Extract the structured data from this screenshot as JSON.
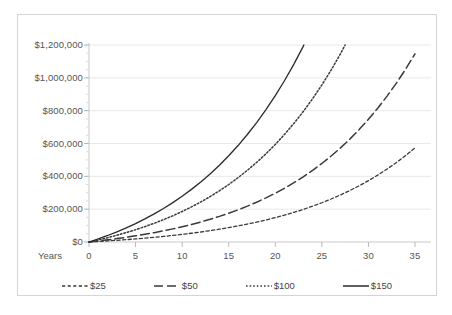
{
  "chart_data": {
    "type": "line",
    "title": "",
    "subtitle": "",
    "xlabel": "Years",
    "ylabel": "",
    "xlim": [
      0,
      35
    ],
    "ylim": [
      0,
      1200000
    ],
    "grid": true,
    "legend_position": "bottom",
    "x_ticks": [
      "0",
      "5",
      "10",
      "15",
      "20",
      "25",
      "30",
      "35"
    ],
    "x_tick_values": [
      0,
      5,
      10,
      15,
      20,
      25,
      30,
      35
    ],
    "y_ticks": [
      "$0",
      "$200,000",
      "$400,000",
      "$600,000",
      "$800,000",
      "$1,000,000",
      "$1,200,000"
    ],
    "y_tick_values": [
      0,
      200000,
      400000,
      600000,
      800000,
      1000000,
      1200000
    ],
    "x": [
      0,
      1,
      2,
      3,
      4,
      5,
      6,
      7,
      8,
      9,
      10,
      11,
      12,
      13,
      14,
      15,
      16,
      17,
      18,
      19,
      20,
      21,
      22,
      23,
      24,
      25,
      26,
      27,
      28,
      29,
      30,
      31,
      32,
      33,
      34,
      35
    ],
    "series": [
      {
        "name": "$25",
        "style": "fine-dashed",
        "color": "#3a3a3a",
        "end_value": 181000,
        "values": [
          0,
          3180,
          6620,
          10340,
          14370,
          18720,
          23430,
          28520,
          34030,
          39990,
          46440,
          53420,
          60970,
          69140,
          77980,
          87550,
          97910,
          109120,
          121250,
          134380,
          148590,
          163970,
          180610,
          198610,
          218090,
          239170,
          261980,
          286670,
          313390,
          342310,
          373610,
          407490,
          444160,
          483840,
          526790,
          573280
        ]
      },
      {
        "name": "$50",
        "style": "long-dashed",
        "color": "#3a3a3a",
        "end_value": 366000,
        "values": [
          0,
          6360,
          13240,
          20680,
          28740,
          37440,
          46860,
          57040,
          68060,
          79980,
          92880,
          106840,
          121940,
          138280,
          155960,
          175100,
          195820,
          218240,
          242500,
          268760,
          297180,
          327940,
          361220,
          397220,
          436180,
          478340,
          523960,
          573340,
          626780,
          684620,
          747220,
          814980,
          888320,
          967680,
          1053580,
          1146560
        ]
      },
      {
        "name": "$100",
        "style": "dotted",
        "color": "#3a3a3a",
        "end_value": 722000,
        "values": [
          0,
          12720,
          26480,
          41360,
          57480,
          74880,
          93720,
          114080,
          136120,
          159960,
          185760,
          213680,
          243880,
          276560,
          311920,
          350200,
          391640,
          436480,
          485000,
          537520,
          594360,
          655880,
          722440,
          794440,
          872360,
          956680,
          1047920,
          1146680,
          1253560,
          1369240,
          1494440,
          1629960,
          1776640,
          1935360,
          2107160,
          2293120
        ]
      },
      {
        "name": "$150",
        "style": "solid",
        "color": "#2a2a2a",
        "end_value": 1085000,
        "values": [
          0,
          19080,
          39720,
          62040,
          86220,
          112320,
          140580,
          171120,
          204180,
          239940,
          278640,
          320520,
          365820,
          414840,
          467880,
          525300,
          587460,
          654720,
          727500,
          806280,
          891540,
          983820,
          1083660,
          1191660,
          1308540,
          1435020,
          1571880,
          1720020,
          1880340,
          2053860,
          2241660,
          2444940,
          2664960,
          2903040,
          3160740,
          3439680
        ]
      }
    ]
  },
  "axis": {
    "years_label": "Years"
  },
  "legend": {
    "items": [
      {
        "label": "$25"
      },
      {
        "label": "$50"
      },
      {
        "label": "$100"
      },
      {
        "label": "$150"
      }
    ]
  }
}
